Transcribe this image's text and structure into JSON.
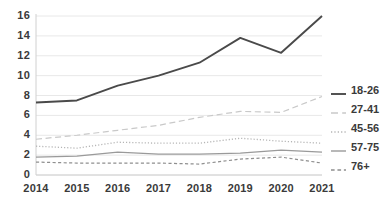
{
  "chart_data": {
    "type": "line",
    "title": "",
    "xlabel": "",
    "ylabel": "",
    "categories": [
      "2014",
      "2015",
      "2016",
      "2017",
      "2018",
      "2019",
      "2020",
      "2021"
    ],
    "x": [
      2014,
      2015,
      2016,
      2017,
      2018,
      2019,
      2020,
      2021
    ],
    "ylim": [
      0,
      16
    ],
    "yticks": [
      0,
      2,
      4,
      6,
      8,
      10,
      12,
      14,
      16
    ],
    "grid": true,
    "legend_position": "right",
    "series": [
      {
        "name": "18-26",
        "values": [
          7.3,
          7.5,
          9.0,
          10.0,
          11.3,
          13.8,
          12.3,
          16.0
        ],
        "color": "#4a4a4a",
        "style": "solid",
        "width": 1.9
      },
      {
        "name": "27-41",
        "values": [
          3.6,
          4.0,
          4.5,
          5.0,
          5.8,
          6.4,
          6.3,
          7.9
        ],
        "color": "#c9c9c9",
        "style": "longdash",
        "width": 1.2
      },
      {
        "name": "45-56",
        "values": [
          2.9,
          2.7,
          3.3,
          3.2,
          3.2,
          3.7,
          3.4,
          3.2
        ],
        "color": "#b5b5b5",
        "style": "dotted",
        "width": 1.3
      },
      {
        "name": "57-75",
        "values": [
          1.8,
          1.9,
          2.3,
          2.1,
          2.1,
          2.2,
          2.5,
          2.3
        ],
        "color": "#9a9a9a",
        "style": "solid",
        "width": 1.2
      },
      {
        "name": "76+",
        "values": [
          1.3,
          1.2,
          1.2,
          1.2,
          1.1,
          1.6,
          1.8,
          1.2
        ],
        "color": "#8f8f8f",
        "style": "dashed",
        "width": 1.2
      }
    ]
  },
  "axis": {
    "y_tick_labels": [
      "16",
      "14",
      "12",
      "10",
      "8",
      "6",
      "4",
      "2",
      "0"
    ],
    "x_tick_labels": [
      "2014",
      "2015",
      "2016",
      "2017",
      "2018",
      "2019",
      "2020",
      "2021"
    ]
  },
  "legend": {
    "items": [
      {
        "label": "18-26",
        "swatch": "line-solid-dark-swatch"
      },
      {
        "label": "27-41",
        "swatch": "line-longdash-swatch"
      },
      {
        "label": "45-56",
        "swatch": "line-dotted-swatch"
      },
      {
        "label": "57-75",
        "swatch": "line-solid-gray-swatch"
      },
      {
        "label": "76+",
        "swatch": "line-dashed-swatch"
      }
    ]
  },
  "style": {
    "background": "#ffffff",
    "gridline_color": "#e8e8e8",
    "axis_color": "#d0d0d0",
    "text_color": "#3a3a3a"
  }
}
